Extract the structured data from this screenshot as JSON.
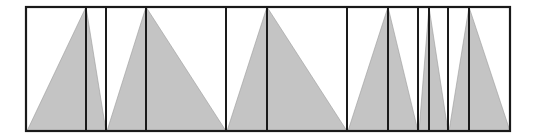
{
  "diagram": {
    "frame": {
      "x1": 26,
      "x2": 510,
      "top": 7,
      "bottom": 131
    },
    "fill_color": "#c4c4c4",
    "stroke_color": "#1a1a1a",
    "vertical_lines": [
      86,
      106,
      146,
      226,
      267,
      347,
      388,
      418,
      429,
      448,
      469
    ],
    "triangles": [
      {
        "left": 27,
        "apex": 86,
        "right": 106
      },
      {
        "left": 107,
        "apex": 146,
        "right": 226
      },
      {
        "left": 227,
        "apex": 267,
        "right": 347
      },
      {
        "left": 348,
        "apex": 388,
        "right": 418
      },
      {
        "left": 419,
        "apex": 429,
        "right": 448
      },
      {
        "left": 449,
        "apex": 469,
        "right": 510
      }
    ]
  }
}
